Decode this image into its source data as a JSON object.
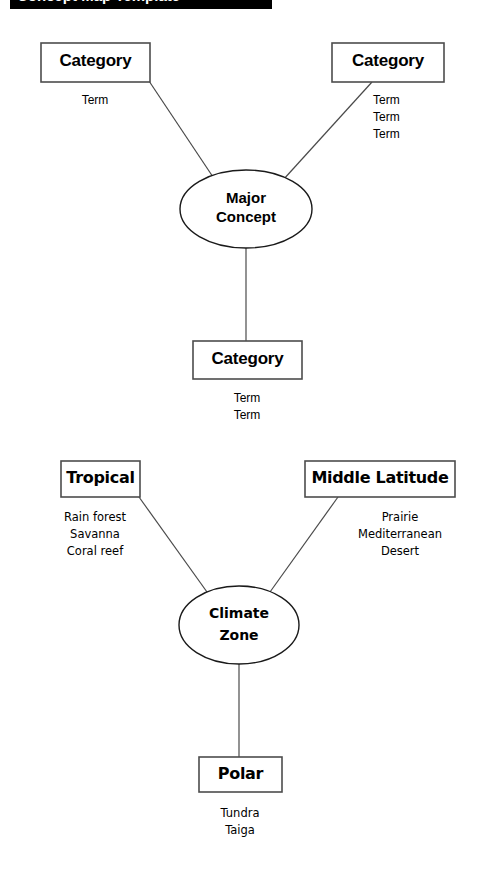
{
  "banner": {
    "text": "Concept Map Template"
  },
  "diagrams": [
    {
      "id": "template-map",
      "center": {
        "label_line1": "Major",
        "label_line2": "Concept"
      },
      "branches": [
        {
          "position": "upper-left",
          "box_label": "Category",
          "terms": [
            "Term"
          ]
        },
        {
          "position": "upper-right",
          "box_label": "Category",
          "terms": [
            "Term",
            "Term",
            "Term"
          ]
        },
        {
          "position": "bottom",
          "box_label": "Category",
          "terms": [
            "Term",
            "Term"
          ]
        }
      ]
    },
    {
      "id": "climate-map",
      "center": {
        "label_line1": "Climate",
        "label_line2": "Zone"
      },
      "branches": [
        {
          "position": "upper-left",
          "box_label": "Tropical",
          "terms": [
            "Rain forest",
            "Savanna",
            "Coral reef"
          ]
        },
        {
          "position": "upper-right",
          "box_label": "Middle Latitude",
          "terms": [
            "Prairie",
            "Mediterranean",
            "Desert"
          ]
        },
        {
          "position": "bottom",
          "box_label": "Polar",
          "terms": [
            "Tundra",
            "Taiga"
          ]
        }
      ]
    }
  ],
  "colors": {
    "page_background": "#ffffff",
    "ink": "#000000",
    "banner_background": "#000000",
    "banner_text": "#ffffff",
    "shape_stroke": "#4d4d4d",
    "link_stroke": "#4a4a4a"
  }
}
